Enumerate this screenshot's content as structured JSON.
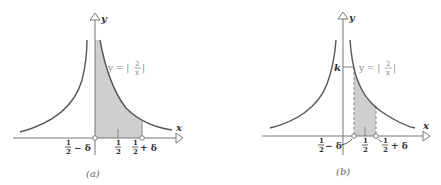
{
  "figure": {
    "panel_a": {
      "caption": "(a)",
      "x_axis_label": "x",
      "y_axis_label": "y",
      "curve_label": "y = |2/x|",
      "curve_label_prefix": "y = |",
      "curve_label_num": "2",
      "curve_label_den": "x",
      "curve_label_suffix": "|",
      "tick_labels": {
        "left": {
          "num": "1",
          "den": "2",
          "suffix": "− δ"
        },
        "mid": {
          "num": "1",
          "den": "2"
        },
        "right": {
          "num": "1",
          "den": "2",
          "suffix": "+ δ"
        }
      },
      "shaded_region": "from x = 0 to x = 1/2 + δ under y = |2/x|"
    },
    "panel_b": {
      "caption": "(b)",
      "x_axis_label": "x",
      "y_axis_label": "y",
      "k_label": "k",
      "curve_label_prefix": "y = |",
      "curve_label_num": "2",
      "curve_label_den": "x",
      "curve_label_suffix": "|",
      "tick_labels": {
        "left": {
          "num": "1",
          "den": "2",
          "suffix": "− δ"
        },
        "mid": {
          "num": "1",
          "den": "2"
        },
        "right": {
          "num": "1",
          "den": "2",
          "suffix": "+ δ"
        }
      },
      "shaded_region": "from x = 1/2 − δ to x = 1/2 + δ under y = |2/x|"
    }
  }
}
